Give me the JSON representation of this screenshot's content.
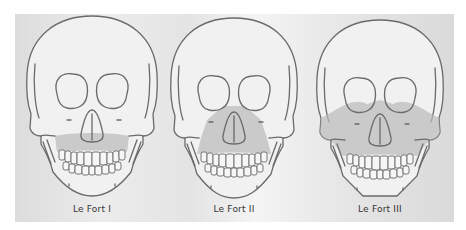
{
  "diagram": {
    "colors": {
      "outline": "#6a6a6a",
      "fracture_shading": "#b9b9b9",
      "panel_background": "#e6e6e6",
      "caption_text": "#333333"
    },
    "figures": [
      {
        "id": "le-fort-1",
        "caption": "Le Fort I",
        "fracture_region": "horizontal maxillary band above teeth"
      },
      {
        "id": "le-fort-2",
        "caption": "Le Fort II",
        "fracture_region": "pyramidal, nasal bridge to maxilla"
      },
      {
        "id": "le-fort-3",
        "caption": "Le Fort III",
        "fracture_region": "craniofacial disjunction, orbits and zygomas"
      }
    ]
  }
}
